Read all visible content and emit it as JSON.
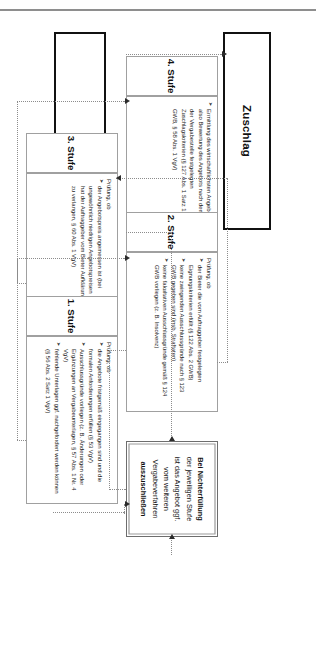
{
  "diagram": {
    "endpoints": {
      "left_label": "Zuschlag",
      "right_label": "Angebotseingang"
    },
    "note": {
      "line1": "Bei Nichterfüllung",
      "line2": "der jeweiligen Stufe",
      "line3": "ist das Angebot ggf.",
      "line4": "vom weiteren",
      "line5": "Vergabeverfahren",
      "line6": "auszuschließen"
    },
    "stages": [
      {
        "id": "stufe-4",
        "title": "4. Stufe",
        "lead": "",
        "bullets": [
          "Ermittlung des wirtschaftlichsten Angebots, also Bewertung des Angebots nach dem von der Vergabestelle festgelegten Zuschlagskriterien (§ 127 Abs. 1 Satz 1 GWB, § 58 Abs. 1 VgV)"
        ]
      },
      {
        "id": "stufe-3",
        "title": "3. Stufe",
        "lead": "Prüfung, ob",
        "bullets": [
          "der Angebotspreis angemessen ist (bei ungewöhnlich niedrigen Angebotspreisen hat der Auftraggeber vom Bieter Aufklärung zu verlangen, § 60 Abs. 1 VgV)"
        ]
      },
      {
        "id": "stufe-2",
        "title": "2. Stufe",
        "lead": "Prüfung, ob",
        "bullets": [
          "der Bieter die vom Auftraggeber festgelegten Eignungskriterien erfüllt (§ 122 Abs. 2 GWB)",
          "keine zwingenden Ausschlussgründe nach § 123 GWB gegeben sind (insb. Straftaten)",
          "keine fakultativen Ausschlussgründe gemäß § 124 GWB vorliegen (z. B. Insolvenz)"
        ]
      },
      {
        "id": "stufe-1",
        "title": "1. Stufe",
        "lead": "Prüfung, ob",
        "bullets": [
          "die Angebote fristgemäß eingegangen sind und die formalen Anforderungen erfüllen (§ 53 VgV)",
          "Ausschlussgründe vorliegen (z. B. Änderungen oder Ergänzungen an Vergabeunterlagen, § 57 Abs. 1 Nr. 4 VgV)",
          "fehlende Unterlagen ggf. nachgefordert werden können (§ 56 Abs. 2 Satz 1 VgV)"
        ]
      }
    ],
    "colors": {
      "box_border_strong": "#111111",
      "box_border_grey": "#9b9b9b",
      "connector": "#8c8c8c",
      "arrow": "#2b2b2b",
      "background": "#ffffff"
    }
  }
}
